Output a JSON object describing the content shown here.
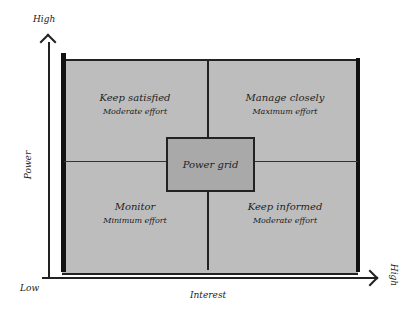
{
  "diagram": {
    "type": "power-interest-grid",
    "center_label": "Power grid",
    "axes": {
      "y": {
        "label": "Power",
        "low": "Low",
        "high": "High"
      },
      "x": {
        "label": "Interest",
        "high": "High"
      }
    },
    "quadrants": {
      "top_left": {
        "title": "Keep satisfied",
        "subtitle": "Moderate effort"
      },
      "top_right": {
        "title": "Manage closely",
        "subtitle": "Maximum effort"
      },
      "bottom_left": {
        "title": "Monitor",
        "subtitle": "Minimum effort"
      },
      "bottom_right": {
        "title": "Keep informed",
        "subtitle": "Moderate effort"
      }
    },
    "colors": {
      "grid_fill": "#bdbdbd",
      "center_fill": "#a9a9a9",
      "lines": "#222222"
    }
  }
}
